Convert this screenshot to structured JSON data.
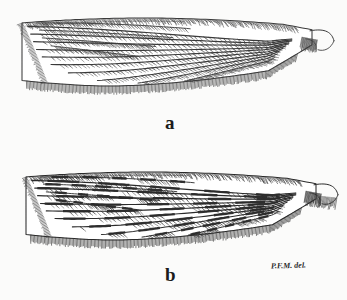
{
  "plate": {
    "title": "Insect wing plate",
    "description": "Two line-drawn insect wings (Psychodidae type) shown in lateral outline with hairy veins and fringed posterior margins",
    "background_color": "#fbfbfa",
    "ink_color": "#1f1f1f",
    "figures": [
      {
        "id": "a",
        "label": "a",
        "name": "wing-figure-a",
        "caption": "a",
        "pattern": "uniform",
        "vein_shade": "#3a3a3a",
        "description": "Wing with evenly hairy veins, rounded apex at left, narrow base at right with small hook-like process"
      },
      {
        "id": "b",
        "label": "b",
        "name": "wing-figure-b",
        "caption": "b",
        "pattern": "banded",
        "vein_shade": "#2b2b2b",
        "description": "Wing with dark banded maculated veins interrupted by pale spots, fringed lobe at base"
      }
    ],
    "signature": {
      "text": "P.F.M. del.",
      "meaning": "artist delineavit mark"
    }
  }
}
